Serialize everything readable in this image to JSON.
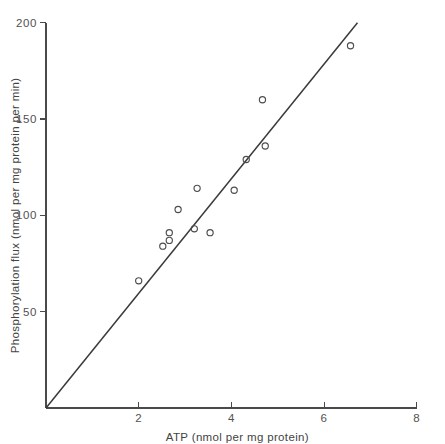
{
  "chart_data": {
    "type": "scatter",
    "title": "",
    "xlabel": "ATP (nmol per mg protein)",
    "ylabel": "Phosphorylation flux (nmol per mg protein per min)",
    "xlim": [
      0,
      8
    ],
    "ylim": [
      0,
      200
    ],
    "xticks": [
      2,
      4,
      6,
      8
    ],
    "yticks": [
      50,
      100,
      150,
      200
    ],
    "xticklabels": [
      "2",
      "4",
      "6",
      "8"
    ],
    "yticklabels": [
      "50",
      "100",
      "150",
      "200"
    ],
    "grid": false,
    "legend": false,
    "marker": "open-circle",
    "points": [
      {
        "x": 2.0,
        "y": 66
      },
      {
        "x": 2.52,
        "y": 84
      },
      {
        "x": 2.66,
        "y": 87
      },
      {
        "x": 2.66,
        "y": 91
      },
      {
        "x": 2.85,
        "y": 103
      },
      {
        "x": 3.2,
        "y": 93
      },
      {
        "x": 3.26,
        "y": 114
      },
      {
        "x": 3.54,
        "y": 91
      },
      {
        "x": 4.06,
        "y": 113
      },
      {
        "x": 4.32,
        "y": 129
      },
      {
        "x": 4.67,
        "y": 160
      },
      {
        "x": 4.73,
        "y": 136
      },
      {
        "x": 6.57,
        "y": 188
      }
    ],
    "series": [
      {
        "name": "fit-line",
        "type": "line",
        "x": [
          0.0,
          6.72
        ],
        "values": [
          0,
          200
        ]
      }
    ],
    "annotations": []
  }
}
